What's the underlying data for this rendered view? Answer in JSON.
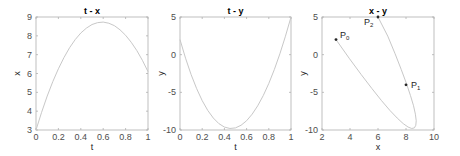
{
  "chart_data": [
    {
      "type": "line",
      "title": "t - x",
      "xlabel": "t",
      "ylabel": "x",
      "xlim": [
        0,
        1
      ],
      "ylim": [
        3,
        9
      ],
      "xticks": [
        0,
        0.2,
        0.4,
        0.6,
        0.8,
        1
      ],
      "xtick_labels": [
        "0",
        "0.2",
        "0.4",
        "0.6",
        "0.8",
        "1"
      ],
      "yticks": [
        3,
        4,
        5,
        6,
        7,
        8,
        9
      ],
      "ytick_labels": [
        "3",
        "4",
        "5",
        "6",
        "7",
        "8",
        "9"
      ],
      "grid": false,
      "series": [
        {
          "name": "x(t)",
          "color": "#c8c8c8",
          "x": [
            0,
            0.05,
            0.1,
            0.15,
            0.2,
            0.25,
            0.3,
            0.35,
            0.4,
            0.45,
            0.5,
            0.55,
            0.6,
            0.65,
            0.7,
            0.75,
            0.8,
            0.85,
            0.9,
            0.95,
            1.0
          ],
          "y": [
            3.0,
            3.94,
            4.8,
            5.57,
            6.25,
            6.85,
            7.37,
            7.8,
            8.15,
            8.41,
            8.6,
            8.7,
            8.73,
            8.67,
            8.54,
            8.32,
            8.03,
            7.66,
            7.22,
            6.7,
            6.1
          ]
        }
      ],
      "box": {
        "left": 36,
        "top": 17,
        "right": 148,
        "bottom": 130
      }
    },
    {
      "type": "line",
      "title": "t - y",
      "xlabel": "t",
      "ylabel": "y",
      "xlim": [
        0,
        1
      ],
      "ylim": [
        -10,
        5
      ],
      "xticks": [
        0,
        0.2,
        0.4,
        0.6,
        0.8,
        1
      ],
      "xtick_labels": [
        "0",
        "0.2",
        "0.4",
        "0.6",
        "0.8",
        "1"
      ],
      "yticks": [
        -10,
        -5,
        0,
        5
      ],
      "ytick_labels": [
        "-10",
        "-5",
        "0",
        "5"
      ],
      "grid": false,
      "series": [
        {
          "name": "y(t)",
          "color": "#c8c8c8",
          "x": [
            0,
            0.05,
            0.1,
            0.15,
            0.2,
            0.25,
            0.3,
            0.35,
            0.4,
            0.45,
            0.5,
            0.55,
            0.6,
            0.65,
            0.7,
            0.75,
            0.8,
            0.85,
            0.9,
            0.95,
            1.0
          ],
          "y": [
            2.0,
            -0.47,
            -2.64,
            -4.51,
            -6.1,
            -7.4,
            -8.41,
            -9.15,
            -9.61,
            -9.8,
            -9.72,
            -9.37,
            -8.77,
            -7.9,
            -6.79,
            -5.43,
            -3.82,
            -1.97,
            0.12,
            2.45,
            5.0
          ]
        }
      ],
      "box": {
        "left": 180,
        "top": 17,
        "right": 291,
        "bottom": 130
      }
    },
    {
      "type": "line",
      "title": "x - y",
      "xlabel": "x",
      "ylabel": "y",
      "xlim": [
        2,
        10
      ],
      "ylim": [
        -10,
        5
      ],
      "xticks": [
        2,
        4,
        6,
        8,
        10
      ],
      "xtick_labels": [
        "2",
        "4",
        "6",
        "8",
        "10"
      ],
      "yticks": [
        -10,
        -5,
        0,
        5
      ],
      "ytick_labels": [
        "-10",
        "-5",
        "0",
        "5"
      ],
      "grid": false,
      "series": [
        {
          "name": "path",
          "color": "#c8c8c8",
          "x": [
            3.0,
            3.94,
            4.8,
            5.57,
            6.25,
            6.85,
            7.37,
            7.8,
            8.15,
            8.41,
            8.6,
            8.7,
            8.73,
            8.67,
            8.54,
            8.32,
            8.03,
            7.66,
            7.22,
            6.7,
            6.0
          ],
          "y": [
            2.0,
            -0.47,
            -2.64,
            -4.51,
            -6.1,
            -7.4,
            -8.41,
            -9.15,
            -9.61,
            -9.8,
            -9.72,
            -9.37,
            -8.77,
            -7.9,
            -6.79,
            -5.43,
            -3.82,
            -1.97,
            0.12,
            2.45,
            5.0
          ]
        }
      ],
      "points": [
        {
          "label": "P",
          "sub": "0",
          "x": 3,
          "y": 2,
          "dx": 4,
          "dy": -2
        },
        {
          "label": "P",
          "sub": "1",
          "x": 8,
          "y": -4,
          "dx": 5,
          "dy": 3
        },
        {
          "label": "P",
          "sub": "2",
          "x": 6,
          "y": 5,
          "dx": -14,
          "dy": 8
        }
      ],
      "box": {
        "left": 322,
        "top": 17,
        "right": 434,
        "bottom": 130
      }
    }
  ]
}
